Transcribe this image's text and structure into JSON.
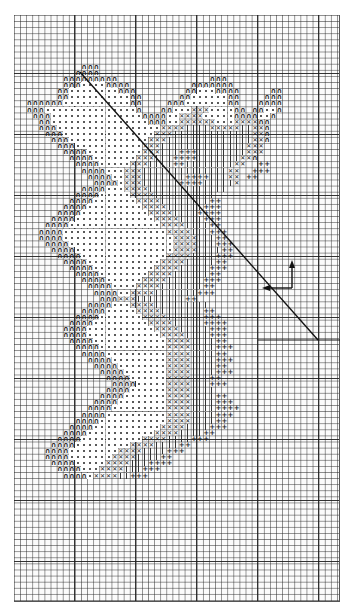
{
  "chart": {
    "type": "needlework-grid-chart",
    "grid": {
      "columns": 53,
      "rows": 96,
      "heavy_line_every": 10,
      "line_color": "#333333",
      "background": "#ffffff"
    },
    "legend_symbols": [
      {
        "key": "A",
        "name": "arch",
        "glyph": "∩"
      },
      {
        "key": "D",
        "name": "dot",
        "glyph": "•"
      },
      {
        "key": "X",
        "name": "cross",
        "glyph": "✕"
      },
      {
        "key": "L",
        "name": "vertical-line",
        "glyph": "|"
      },
      {
        "key": "P",
        "name": "plus",
        "glyph": "+"
      }
    ],
    "reference_line": {
      "from": [
        80,
        72
      ],
      "to": [
        318,
        340
      ],
      "color": "#111111"
    },
    "orientation_arrow": {
      "origin": [
        292,
        288
      ],
      "up_to": [
        293,
        262
      ],
      "left_to": [
        263,
        288
      ]
    },
    "pattern_rows": [
      {
        "row": 8,
        "runs": [
          [
            11,
            "AAA"
          ]
        ]
      },
      {
        "row": 9,
        "runs": [
          [
            10,
            "AAAA"
          ]
        ]
      },
      {
        "row": 10,
        "runs": [
          [
            8,
            "AAAAAAAAA"
          ],
          [
            32,
            "AAA"
          ]
        ]
      },
      {
        "row": 11,
        "runs": [
          [
            8,
            "AAADDDDAAAA"
          ],
          [
            29,
            "AAAAAAA"
          ]
        ]
      },
      {
        "row": 12,
        "runs": [
          [
            7,
            "AADDDDDDDDAAA"
          ],
          [
            28,
            "AADDDAAAA"
          ],
          [
            42,
            "AA"
          ]
        ]
      },
      {
        "row": 13,
        "runs": [
          [
            7,
            "AADDDDDDDDDDAA"
          ],
          [
            27,
            "AADDDDDDAA"
          ],
          [
            41,
            "AAA"
          ]
        ]
      },
      {
        "row": 14,
        "runs": [
          [
            2,
            "AAAAAADDDDDDDDDDDAA"
          ],
          [
            25,
            "AAADDDDDDDAA"
          ],
          [
            40,
            "AAAA"
          ]
        ]
      },
      {
        "row": 15,
        "runs": [
          [
            2,
            "AAADDDDDDDDDDDDDDDA"
          ],
          [
            24,
            "AADDDXXXDDDDAA"
          ],
          [
            39,
            "AADDA"
          ]
        ]
      },
      {
        "row": 16,
        "runs": [
          [
            3,
            "AAADDDDDDDDDDDDDDDAA"
          ],
          [
            23,
            "AADDXXXXDDDDDAA"
          ],
          [
            38,
            "AADDA"
          ]
        ]
      },
      {
        "row": 17,
        "runs": [
          [
            4,
            "AADDDDDDDDDDDDDDDDAAADDXXXXXXDDDXXXXAA"
          ]
        ]
      },
      {
        "row": 18,
        "runs": [
          [
            4,
            "AAADDDDDDDDDDDDDDDDDXXXXLLLLXXXXXLLXXA"
          ]
        ]
      },
      {
        "row": 19,
        "runs": [
          [
            5,
            "AAADDDDDDDDDDDDDDDXXXLLLLLLLLLLLLLXXA"
          ]
        ]
      },
      {
        "row": 20,
        "runs": [
          [
            6,
            "AAADDDDDDDDDDDDDXXXLLLLLLLLLLLLLLXXA"
          ]
        ]
      },
      {
        "row": 21,
        "runs": [
          [
            7,
            "AAADDDDDDDDDDDXXXLLLLLLLLLLLLLLXXX"
          ]
        ]
      },
      {
        "row": 22,
        "runs": [
          [
            8,
            "AAAADDDDDDDDDXXXLLLPPPLLLLLLLLXXX"
          ]
        ]
      },
      {
        "row": 23,
        "runs": [
          [
            9,
            "AAAADDDDDDDXXXLLLPPPPLLLLLLLXXA"
          ]
        ]
      },
      {
        "row": 24,
        "runs": [
          [
            10,
            "AAAADDDDDXXXLLLLPPLLLLLLLLXX"
          ],
          [
            40,
            "PP"
          ]
        ]
      },
      {
        "row": 25,
        "runs": [
          [
            11,
            "AAAADDDXXXLLLLLLLLLLLLLLXX"
          ],
          [
            39,
            "PPP"
          ]
        ]
      },
      {
        "row": 26,
        "runs": [
          [
            12,
            "AAAADDXXXLLLLLLLPPPPLLLXX"
          ],
          [
            38,
            "PP"
          ]
        ]
      },
      {
        "row": 27,
        "runs": [
          [
            13,
            "AAAADXXXLLLLLLPPPPLLLLLX"
          ]
        ]
      },
      {
        "row": 28,
        "runs": [
          [
            11,
            "AAAADDDXXXXLLLLLLLLLLLLL"
          ]
        ]
      },
      {
        "row": 29,
        "runs": [
          [
            10,
            "AAAADDDDDXXXXLLLLLLLLLL"
          ]
        ]
      },
      {
        "row": 30,
        "runs": [
          [
            9,
            "AAAADDDDDDDXXXXLLLLLLLLPP"
          ]
        ]
      },
      {
        "row": 31,
        "runs": [
          [
            8,
            "AAAADDDDDDDDDXXXXLLLLLLPPP"
          ]
        ]
      },
      {
        "row": 32,
        "runs": [
          [
            7,
            "AAAADDDDDDDDDDDXXXXLLLLPPPP"
          ]
        ]
      },
      {
        "row": 33,
        "runs": [
          [
            6,
            "AAAADDDDDDDDDDDDDXXXXLLLLPPP"
          ]
        ]
      },
      {
        "row": 34,
        "runs": [
          [
            5,
            "AAAADDDDDDDDDDDDDDDXXXXLLLLPP"
          ]
        ]
      },
      {
        "row": 35,
        "runs": [
          [
            4,
            "AAAADDDDDDDDDDDDDDDDDXXXXLLLPPP"
          ]
        ]
      },
      {
        "row": 36,
        "runs": [
          [
            4,
            "AAAADDDDDDDDDDDDDDDDDDXXXXLLLPP"
          ]
        ]
      },
      {
        "row": 37,
        "runs": [
          [
            5,
            "AAAADDDDDDDDDDDDDDDDDXXXXLLLPPP"
          ]
        ]
      },
      {
        "row": 38,
        "runs": [
          [
            6,
            "AAAADDDDDDDDDDDDDDDDXXXXLLLLPP"
          ]
        ]
      },
      {
        "row": 39,
        "runs": [
          [
            7,
            "AAAADDDDDDDDDDDDDDXXXXLLLLPPP"
          ]
        ]
      },
      {
        "row": 40,
        "runs": [
          [
            8,
            "AAAADDDDDDDDDDDDXXXXLLLLLPP"
          ]
        ]
      },
      {
        "row": 41,
        "runs": [
          [
            9,
            "AAAADDDDDDDDDDXXXXLLLLLPPP"
          ]
        ]
      },
      {
        "row": 42,
        "runs": [
          [
            10,
            "AAAADDDDDDDDXXXXLLLLLLPP"
          ]
        ]
      },
      {
        "row": 43,
        "runs": [
          [
            11,
            "AAAADDDDDDXXXXLLLLLLPPP"
          ]
        ]
      },
      {
        "row": 44,
        "runs": [
          [
            12,
            "AAAADDDDXXXXLLLLLLLPP"
          ]
        ]
      },
      {
        "row": 45,
        "runs": [
          [
            13,
            "AAAADDXXXXLLLLLLLPPP"
          ]
        ]
      },
      {
        "row": 46,
        "runs": [
          [
            14,
            "AAAXXXLLLLLLLLPP"
          ]
        ]
      },
      {
        "row": 47,
        "runs": [
          [
            12,
            "AAAADDDXXXXLLLLLLLLL"
          ]
        ]
      },
      {
        "row": 48,
        "runs": [
          [
            11,
            "AAAADDDDDXXXXLLLLLLLPP"
          ]
        ]
      },
      {
        "row": 49,
        "runs": [
          [
            10,
            "AAAADDDDDDDXXXXLLLLLLPPP"
          ]
        ]
      },
      {
        "row": 50,
        "runs": [
          [
            9,
            "AAAADDDDDDDDDXXXXLLLLLPPPP"
          ]
        ]
      },
      {
        "row": 51,
        "runs": [
          [
            8,
            "AAAADDDDDDDDDDDXXXXLLLLLPPP"
          ]
        ]
      },
      {
        "row": 52,
        "runs": [
          [
            8,
            "AAAADDDDDDDDDDDDXXXXLLLLPPP"
          ]
        ]
      },
      {
        "row": 53,
        "runs": [
          [
            9,
            "AAAADDDDDDDDDDDDXXXXLLLLPP"
          ]
        ]
      },
      {
        "row": 54,
        "runs": [
          [
            10,
            "AAAADDDDDDDDDDDXXXXLLLLPPP"
          ]
        ]
      },
      {
        "row": 55,
        "runs": [
          [
            11,
            "AAAADDDDDDDDDDXXXXLLLLPP"
          ]
        ]
      },
      {
        "row": 56,
        "runs": [
          [
            12,
            "AAAADDDDDDDDDXXXXLLLLPPP"
          ]
        ]
      },
      {
        "row": 57,
        "runs": [
          [
            13,
            "AAAADDDDDDDDXXXXLLLLPP"
          ]
        ]
      },
      {
        "row": 58,
        "runs": [
          [
            14,
            "AAAADDDDDDDXXXXLLLLPPP"
          ]
        ]
      },
      {
        "row": 59,
        "runs": [
          [
            15,
            "AAAADDDDDDXXXXLLLPP"
          ]
        ]
      },
      {
        "row": 60,
        "runs": [
          [
            16,
            "AAAADDDDDXXXXLLLPPP"
          ]
        ]
      },
      {
        "row": 61,
        "runs": [
          [
            15,
            "AAAADDDDDDXXXXLLLL"
          ]
        ]
      },
      {
        "row": 62,
        "runs": [
          [
            14,
            "AAAADDDDDDDXXXXLLLLPP"
          ]
        ]
      },
      {
        "row": 63,
        "runs": [
          [
            13,
            "AAAADDDDDDDDXXXXLLLLPPP"
          ]
        ]
      },
      {
        "row": 64,
        "runs": [
          [
            12,
            "AAAADDDDDDDDDXXXXLLLLPPPP"
          ]
        ]
      },
      {
        "row": 65,
        "runs": [
          [
            11,
            "AAAADDDDDDDDDDXXXXLLLLPPP"
          ]
        ]
      },
      {
        "row": 66,
        "runs": [
          [
            10,
            "AAAADDDDDDDDDDDXXXXLLLLPP"
          ]
        ]
      },
      {
        "row": 67,
        "runs": [
          [
            9,
            "AAAADDDDDDDDDDDXXXXLLLLPPP"
          ]
        ]
      },
      {
        "row": 68,
        "runs": [
          [
            8,
            "AAAADDDDDDDDDDDXXXXLLLLPP"
          ]
        ]
      },
      {
        "row": 69,
        "runs": [
          [
            7,
            "AAAADDDDDDDDDDXXXXLLLLPPP"
          ]
        ]
      },
      {
        "row": 70,
        "runs": [
          [
            6,
            "AAAADDDDDDDDDXXXXLLLLPP"
          ]
        ]
      },
      {
        "row": 71,
        "runs": [
          [
            5,
            "AAAADDDDDDDDXXXXLLLLPPP"
          ]
        ]
      },
      {
        "row": 72,
        "runs": [
          [
            5,
            "AAAADDDDDDDXXXXLLLLPP"
          ]
        ]
      },
      {
        "row": 73,
        "runs": [
          [
            6,
            "AAAADDDDDXXXXLLLPPPP"
          ]
        ]
      },
      {
        "row": 74,
        "runs": [
          [
            7,
            "AAAADDDXXXXLLLPPP"
          ]
        ]
      },
      {
        "row": 75,
        "runs": [
          [
            8,
            "AAAADXXXXLLPPP"
          ]
        ]
      }
    ]
  }
}
